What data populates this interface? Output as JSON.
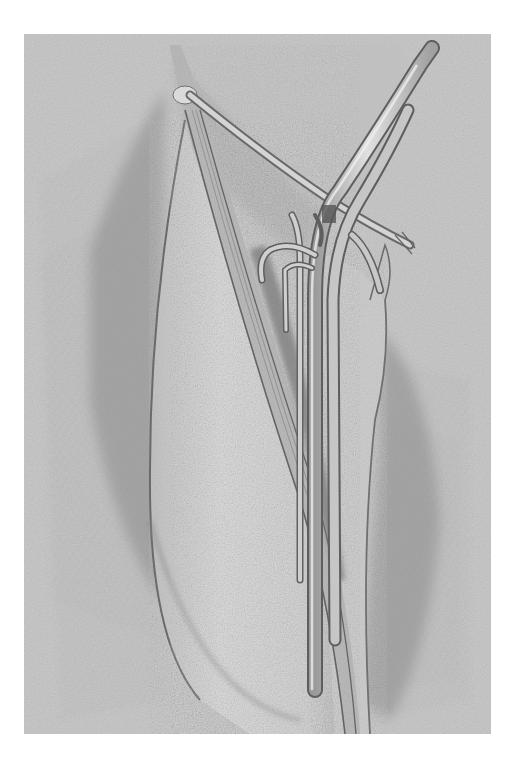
{
  "image": {
    "kind": "pencil anatomical illustration",
    "subject": "anterior thigh with exposed femoral vessels and sartorius muscle",
    "frame": {
      "x": 24,
      "y": 34,
      "width": 467,
      "height": 700
    },
    "colors": {
      "page": "#ffffff",
      "paper": "#c9c9c9",
      "paper_light": "#d6d6d6",
      "skin_light": "#d9d9d9",
      "shade": "#8f8f8f",
      "shade_dark": "#6e6e6e",
      "line": "#5a5a5a",
      "vessel": "#bdbdbd",
      "vessel_hi": "#e2e2e2"
    }
  }
}
